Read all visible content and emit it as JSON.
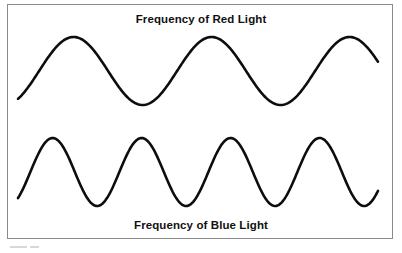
{
  "figure": {
    "background_color": "#ffffff",
    "border_color": "#8a8a8a",
    "stroke_color": "#0d0d0d",
    "top_caption": "Frequency of Red Light",
    "bottom_caption": "Frequency of Blue Light"
  },
  "chart_data": {
    "type": "line",
    "title": "Frequency of Red Light",
    "subtitle": "Frequency of Blue Light",
    "xlabel": "",
    "ylabel": "",
    "grid": false,
    "legend": "none",
    "axis_visible": false,
    "xlim": [
      18,
      378
    ],
    "series": [
      {
        "name": "Frequency of Red Light",
        "label": "Frequency of Red Light",
        "waveform": "sine",
        "color": "#0d0d0d",
        "cycles": 2.6,
        "period_px": 138,
        "amplitude_px": 34,
        "baseline_y": 71,
        "phase_deg": -55,
        "x_start": 18,
        "x_end": 378,
        "peaks_x": [
          50,
          188,
          325
        ],
        "troughs_x": [
          120,
          256
        ],
        "peak_y": 37,
        "trough_y": 105,
        "relative_frequency": "low"
      },
      {
        "name": "Frequency of Blue Light",
        "label": "Frequency of Blue Light",
        "waveform": "sine",
        "color": "#0d0d0d",
        "cycles": 4.0,
        "period_px": 89,
        "amplitude_px": 34,
        "baseline_y": 172,
        "phase_deg": -50,
        "x_start": 18,
        "x_end": 378,
        "peaks_x": [
          40,
          129,
          218,
          307
        ],
        "troughs_x": [
          85,
          174,
          263,
          352
        ],
        "peak_y": 138,
        "trough_y": 206,
        "relative_frequency": "high"
      }
    ]
  }
}
